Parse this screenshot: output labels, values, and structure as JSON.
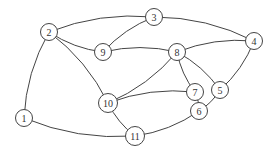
{
  "diagram": {
    "type": "undirected-graph",
    "colors": {
      "stroke": "#444444",
      "node_fill": "#ffffff",
      "label": "#333333",
      "background": "#ffffff"
    },
    "nodes": [
      {
        "id": "1",
        "label": "1",
        "x": 24,
        "y": 118
      },
      {
        "id": "2",
        "label": "2",
        "x": 49,
        "y": 32
      },
      {
        "id": "3",
        "label": "3",
        "x": 154,
        "y": 17
      },
      {
        "id": "4",
        "label": "4",
        "x": 254,
        "y": 41
      },
      {
        "id": "5",
        "label": "5",
        "x": 220,
        "y": 90
      },
      {
        "id": "6",
        "label": "6",
        "x": 199,
        "y": 111
      },
      {
        "id": "7",
        "label": "7",
        "x": 195,
        "y": 92
      },
      {
        "id": "8",
        "label": "8",
        "x": 177,
        "y": 52
      },
      {
        "id": "9",
        "label": "9",
        "x": 103,
        "y": 52
      },
      {
        "id": "10",
        "label": "10",
        "x": 108,
        "y": 103
      },
      {
        "id": "11",
        "label": "11",
        "x": 135,
        "y": 136
      }
    ],
    "edges": [
      {
        "from": "1",
        "to": "2",
        "path": "M20,107 C8,90 5,60 15,45 C22,36 30,31 39,31"
      },
      {
        "from": "1",
        "to": "11",
        "path": "M32,126 C45,140 70,146 100,144 C112,143 118,139 125,138"
      },
      {
        "from": "2",
        "to": "3",
        "path": "M57,25 C65,14 75,10 88,14 C105,18 120,14 144,15"
      },
      {
        "from": "2",
        "to": "9",
        "path": "M56,40 C66,48 78,52 93,51"
      },
      {
        "from": "2",
        "to": "10",
        "path": "M55,41 C65,55 75,65 80,80 C82,90 92,96 98,101"
      },
      {
        "from": "3",
        "to": "9",
        "path": "M146,24 C135,32 122,40 111,47"
      },
      {
        "from": "3",
        "to": "4",
        "path": "M164,15 C178,13 188,28 200,24 C215,18 225,20 236,30 C240,34 242,38 244,40"
      },
      {
        "from": "4",
        "to": "8",
        "path": "M245,47 C230,53 215,55 203,55 C195,55 190,54 187,53"
      },
      {
        "from": "4",
        "to": "5",
        "path": "M257,51 C253,60 248,65 248,75 C248,84 240,90 230,90"
      },
      {
        "from": "8",
        "to": "9",
        "path": "M167,53 C158,56 150,62 140,62 C128,62 120,55 113,54"
      },
      {
        "from": "8",
        "to": "10",
        "path": "M170,60 C155,70 135,80 120,92 C116,96 114,98 116,98"
      },
      {
        "from": "8",
        "to": "7",
        "path": "M178,62 C178,70 172,72 173,80 C174,84 180,88 185,90"
      },
      {
        "from": "8",
        "to": "5",
        "path": "M182,61 C188,70 190,80 200,85 C205,88 208,89 210,89"
      },
      {
        "from": "7",
        "to": "10",
        "path": "M185,95 C170,98 150,98 135,99 C126,100 122,102 118,103"
      },
      {
        "from": "7",
        "to": "6",
        "path": "M200,101 C200,105 198,106 199,101"
      },
      {
        "from": "6",
        "to": "5",
        "path": "M207,105 C210,102 212,98 213,97"
      },
      {
        "from": "6",
        "to": "11",
        "path": "M191,117 C180,122 170,124 160,128 C152,132 148,134 145,135"
      },
      {
        "from": "10",
        "to": "11",
        "path": "M113,112 C115,120 118,125 126,130"
      }
    ]
  }
}
